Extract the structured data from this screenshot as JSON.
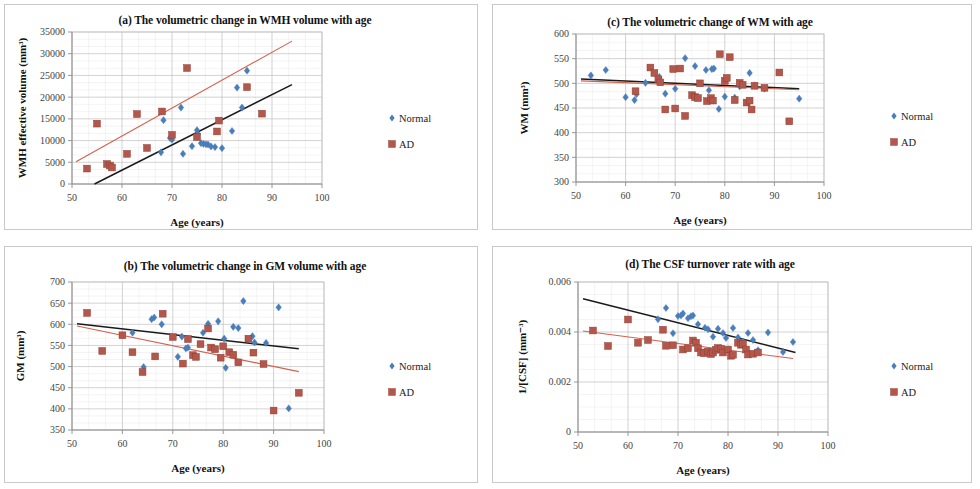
{
  "figure": {
    "panel_count": 4,
    "legend_labels": [
      "Normal",
      "AD"
    ],
    "series_colors": {
      "normal": "#4a7ebb",
      "ad": "#b5564a"
    },
    "trend_colors": {
      "normal": "#1a1a1a",
      "ad": "#d4614f"
    },
    "shared_xlabel": "Age (years)"
  },
  "chart_data": [
    {
      "id": "panel-a",
      "type": "scatter",
      "title": "(a) The volumetric change in WMH volume with age",
      "xlabel": "Age (years)",
      "ylabel": "WMH effective volume (mm³)",
      "xlim": [
        50,
        100
      ],
      "ylim": [
        0,
        35000
      ],
      "xticks": [
        50,
        60,
        70,
        80,
        90,
        100
      ],
      "yticks": [
        0,
        5000,
        10000,
        15000,
        20000,
        25000,
        30000,
        35000
      ],
      "ytick_labels": [
        "0",
        "5000",
        "10000",
        "15000",
        "20000",
        "25000",
        "30000",
        "35000"
      ],
      "grid": true,
      "legend_position": "right",
      "series": [
        {
          "name": "Normal",
          "marker": "diamond",
          "color": "#4a7ebb",
          "points": [
            [
              67.8,
              7300
            ],
            [
              68.3,
              14700
            ],
            [
              69.6,
              10600
            ],
            [
              70.0,
              10200
            ],
            [
              71.8,
              17600
            ],
            [
              72.2,
              6950
            ],
            [
              74.0,
              8700
            ],
            [
              75.0,
              12400
            ],
            [
              75.2,
              11500
            ],
            [
              75.8,
              9400
            ],
            [
              76.3,
              9250
            ],
            [
              76.8,
              9150
            ],
            [
              77.2,
              9100
            ],
            [
              77.8,
              8650
            ],
            [
              78.6,
              8500
            ],
            [
              80.0,
              8250
            ],
            [
              82.0,
              12200
            ],
            [
              83.0,
              22200
            ],
            [
              84.0,
              17600
            ],
            [
              85.0,
              26100
            ]
          ]
        },
        {
          "name": "AD",
          "marker": "square",
          "color": "#b5564a",
          "points": [
            [
              53.0,
              3550
            ],
            [
              55.0,
              13900
            ],
            [
              57.0,
              4600
            ],
            [
              57.6,
              4250
            ],
            [
              58.0,
              3800
            ],
            [
              61.0,
              6950
            ],
            [
              63.0,
              16100
            ],
            [
              65.0,
              8300
            ],
            [
              68.0,
              16700
            ],
            [
              70.0,
              11300
            ],
            [
              73.0,
              26700
            ],
            [
              75.0,
              10800
            ],
            [
              79.0,
              12100
            ],
            [
              79.4,
              14600
            ],
            [
              85.0,
              22300
            ],
            [
              88.0,
              16200
            ]
          ]
        }
      ],
      "trendlines": [
        {
          "name": "Normal",
          "color": "#1a1a1a",
          "x1": 54.5,
          "y1": 0,
          "x2": 94.0,
          "y2": 22900
        },
        {
          "name": "AD",
          "color": "#d4614f",
          "x1": 50.8,
          "y1": 5100,
          "x2": 94.0,
          "y2": 32900
        }
      ]
    },
    {
      "id": "panel-b",
      "type": "scatter",
      "title": "(b) The volumetric change in GM volume with age",
      "xlabel": "Age (years)",
      "ylabel": "GM (mm³)",
      "xlim": [
        50,
        100
      ],
      "ylim": [
        350,
        700
      ],
      "xticks": [
        50,
        60,
        70,
        80,
        90,
        100
      ],
      "yticks": [
        350,
        400,
        450,
        500,
        550,
        600,
        650,
        700
      ],
      "ytick_labels": [
        "350",
        "400",
        "450",
        "500",
        "550",
        "600",
        "650",
        "700"
      ],
      "grid": true,
      "legend_position": "right",
      "series": [
        {
          "name": "Normal",
          "marker": "diamond",
          "color": "#4a7ebb",
          "points": [
            [
              62.0,
              580
            ],
            [
              64.2,
              499
            ],
            [
              65.8,
              612
            ],
            [
              66.3,
              616
            ],
            [
              67.8,
              600
            ],
            [
              71.0,
              523
            ],
            [
              71.8,
              571
            ],
            [
              72.6,
              543
            ],
            [
              73.0,
              545
            ],
            [
              76.0,
              580
            ],
            [
              77.0,
              601
            ],
            [
              79.0,
              607
            ],
            [
              80.2,
              566
            ],
            [
              80.5,
              497
            ],
            [
              82.0,
              594
            ],
            [
              83.0,
              591
            ],
            [
              84.0,
              655
            ],
            [
              85.8,
              572
            ],
            [
              86.2,
              557
            ],
            [
              88.5,
              556
            ],
            [
              91.0,
              640
            ],
            [
              93.0,
              401
            ]
          ]
        },
        {
          "name": "AD",
          "marker": "square",
          "color": "#b5564a",
          "points": [
            [
              53.0,
              627
            ],
            [
              56.0,
              537
            ],
            [
              60.0,
              574
            ],
            [
              62.0,
              534
            ],
            [
              64.0,
              487
            ],
            [
              66.5,
              524
            ],
            [
              68.0,
              625
            ],
            [
              70.0,
              570
            ],
            [
              72.0,
              507
            ],
            [
              73.0,
              565
            ],
            [
              74.0,
              527
            ],
            [
              74.6,
              523
            ],
            [
              75.5,
              553
            ],
            [
              77.0,
              590
            ],
            [
              77.6,
              545
            ],
            [
              78.4,
              541
            ],
            [
              79.5,
              521
            ],
            [
              80.0,
              548
            ],
            [
              81.2,
              534
            ],
            [
              82.0,
              528
            ],
            [
              83.0,
              510
            ],
            [
              85.0,
              566
            ],
            [
              86.0,
              533
            ],
            [
              88.0,
              506
            ],
            [
              90.0,
              396
            ],
            [
              95.0,
              438
            ]
          ]
        }
      ],
      "trendlines": [
        {
          "name": "Normal",
          "color": "#1a1a1a",
          "x1": 51.0,
          "y1": 601,
          "x2": 95.0,
          "y2": 542
        },
        {
          "name": "AD",
          "color": "#d4614f",
          "x1": 51.0,
          "y1": 596,
          "x2": 95.0,
          "y2": 488
        }
      ]
    },
    {
      "id": "panel-c",
      "type": "scatter",
      "title": "(c) The volumetric change of WM with age",
      "xlabel": "Age (years)",
      "ylabel": "WM (mm³)",
      "xlim": [
        50,
        100
      ],
      "ylim": [
        300,
        600
      ],
      "xticks": [
        50,
        60,
        70,
        80,
        90,
        100
      ],
      "yticks": [
        300,
        350,
        400,
        450,
        500,
        550,
        600
      ],
      "ytick_labels": [
        "300",
        "350",
        "400",
        "450",
        "500",
        "550",
        "600"
      ],
      "grid": true,
      "legend_position": "right",
      "series": [
        {
          "name": "Normal",
          "marker": "diamond",
          "color": "#4a7ebb",
          "points": [
            [
              53.0,
              516
            ],
            [
              56.0,
              527
            ],
            [
              60.0,
              472
            ],
            [
              61.8,
              466
            ],
            [
              62.2,
              478
            ],
            [
              64.0,
              501
            ],
            [
              66.8,
              513
            ],
            [
              68.0,
              479
            ],
            [
              70.0,
              489
            ],
            [
              72.0,
              551
            ],
            [
              74.0,
              535
            ],
            [
              76.2,
              527
            ],
            [
              76.8,
              486
            ],
            [
              77.4,
              529
            ],
            [
              77.8,
              530
            ],
            [
              78.8,
              448
            ],
            [
              80.0,
              473
            ],
            [
              82.0,
              471
            ],
            [
              83.0,
              494
            ],
            [
              85.0,
              521
            ],
            [
              86.0,
              496
            ],
            [
              88.0,
              489
            ],
            [
              95.0,
              469
            ]
          ]
        },
        {
          "name": "AD",
          "marker": "square",
          "color": "#b5564a",
          "points": [
            [
              62.0,
              484
            ],
            [
              65.0,
              532
            ],
            [
              65.8,
              521
            ],
            [
              66.6,
              508
            ],
            [
              67.0,
              502
            ],
            [
              68.0,
              447
            ],
            [
              69.6,
              529
            ],
            [
              70.0,
              449
            ],
            [
              71.0,
              530
            ],
            [
              72.0,
              434
            ],
            [
              73.4,
              476
            ],
            [
              74.0,
              472
            ],
            [
              74.6,
              470
            ],
            [
              75.0,
              500
            ],
            [
              76.4,
              464
            ],
            [
              77.2,
              470
            ],
            [
              77.6,
              465
            ],
            [
              79.0,
              559
            ],
            [
              80.0,
              505
            ],
            [
              80.4,
              511
            ],
            [
              81.0,
              553
            ],
            [
              82.0,
              466
            ],
            [
              83.0,
              501
            ],
            [
              83.6,
              497
            ],
            [
              84.4,
              461
            ],
            [
              85.0,
              465
            ],
            [
              85.4,
              447
            ],
            [
              86.0,
              495
            ],
            [
              88.0,
              491
            ],
            [
              91.0,
              522
            ],
            [
              93.0,
              423
            ]
          ]
        }
      ],
      "trendlines": [
        {
          "name": "Normal",
          "color": "#1a1a1a",
          "x1": 51.0,
          "y1": 509,
          "x2": 95.0,
          "y2": 489
        },
        {
          "name": "AD",
          "color": "#d4614f",
          "x1": 51.0,
          "y1": 505,
          "x2": 95.0,
          "y2": 487
        }
      ]
    },
    {
      "id": "panel-d",
      "type": "scatter",
      "title": "(d) The CSF turnover rate with age",
      "xlabel": "Age (years)",
      "ylabel": "1/[CSF] (mm⁻³)",
      "xlim": [
        50,
        100
      ],
      "ylim": [
        0,
        0.006
      ],
      "xticks": [
        50,
        60,
        70,
        80,
        90,
        100
      ],
      "yticks": [
        0,
        0.002,
        0.004,
        0.006
      ],
      "ytick_labels": [
        "0",
        "0.002",
        "0.004",
        "0.006"
      ],
      "grid": true,
      "legend_position": "right",
      "series": [
        {
          "name": "Normal",
          "marker": "diamond",
          "color": "#4a7ebb",
          "points": [
            [
              66.0,
              0.00451
            ],
            [
              67.6,
              0.00496
            ],
            [
              69.0,
              0.00395
            ],
            [
              70.0,
              0.00464
            ],
            [
              70.6,
              0.00466
            ],
            [
              71.0,
              0.00474
            ],
            [
              72.0,
              0.00455
            ],
            [
              72.6,
              0.00463
            ],
            [
              73.0,
              0.00466
            ],
            [
              74.0,
              0.00431
            ],
            [
              75.4,
              0.00417
            ],
            [
              76.0,
              0.00411
            ],
            [
              77.0,
              0.00381
            ],
            [
              78.0,
              0.00413
            ],
            [
              79.0,
              0.00396
            ],
            [
              79.6,
              0.00376
            ],
            [
              81.0,
              0.00416
            ],
            [
              82.0,
              0.00378
            ],
            [
              83.0,
              0.00362
            ],
            [
              84.0,
              0.00396
            ],
            [
              85.0,
              0.00368
            ],
            [
              86.0,
              0.00327
            ],
            [
              88.0,
              0.00398
            ],
            [
              91.0,
              0.0032
            ],
            [
              93.0,
              0.0036
            ]
          ]
        },
        {
          "name": "AD",
          "marker": "square",
          "color": "#b5564a",
          "points": [
            [
              53.0,
              0.00406
            ],
            [
              56.0,
              0.00344
            ],
            [
              60.0,
              0.0045
            ],
            [
              62.0,
              0.00357
            ],
            [
              64.0,
              0.00368
            ],
            [
              67.0,
              0.00409
            ],
            [
              67.6,
              0.00345
            ],
            [
              69.0,
              0.00347
            ],
            [
              71.0,
              0.0033
            ],
            [
              72.0,
              0.00335
            ],
            [
              73.0,
              0.00366
            ],
            [
              73.6,
              0.00357
            ],
            [
              74.0,
              0.00335
            ],
            [
              74.6,
              0.00318
            ],
            [
              75.2,
              0.00315
            ],
            [
              76.0,
              0.00322
            ],
            [
              76.6,
              0.00312
            ],
            [
              77.0,
              0.00318
            ],
            [
              77.6,
              0.00329
            ],
            [
              78.0,
              0.00336
            ],
            [
              78.6,
              0.00333
            ],
            [
              79.0,
              0.00318
            ],
            [
              80.0,
              0.0033
            ],
            [
              80.6,
              0.00305
            ],
            [
              81.0,
              0.00309
            ],
            [
              82.0,
              0.00357
            ],
            [
              82.6,
              0.00349
            ],
            [
              83.0,
              0.00352
            ],
            [
              83.6,
              0.0033
            ],
            [
              84.0,
              0.0031
            ],
            [
              85.0,
              0.00313
            ],
            [
              86.0,
              0.00318
            ]
          ]
        }
      ],
      "trendlines": [
        {
          "name": "Normal",
          "color": "#1a1a1a",
          "x1": 51.0,
          "y1": 0.00533,
          "x2": 93.5,
          "y2": 0.00318
        },
        {
          "name": "AD",
          "color": "#d4614f",
          "x1": 51.0,
          "y1": 0.00404,
          "x2": 93.0,
          "y2": 0.00294
        }
      ]
    }
  ]
}
